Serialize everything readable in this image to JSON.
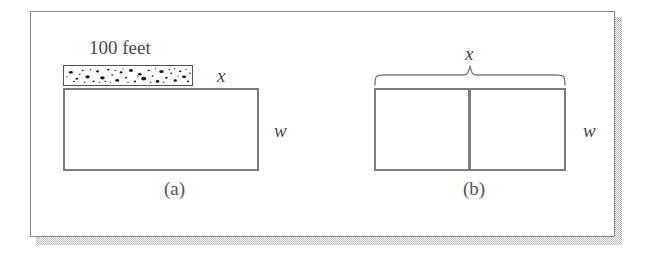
{
  "figure": {
    "panel": {
      "background": "#ffffff",
      "border_color": "#8a8a8a"
    },
    "stroke_color": "#7d7d7d",
    "text_color": "#4a4a4a"
  },
  "diagram_a": {
    "caption": "(a)",
    "wall_label": "100 feet",
    "top_side_label": "x",
    "right_side_label": "w",
    "wall_pattern": "speckled-gravel"
  },
  "diagram_b": {
    "caption": "(b)",
    "brace_label": "x",
    "right_side_label": "w",
    "divider_count": 1
  }
}
